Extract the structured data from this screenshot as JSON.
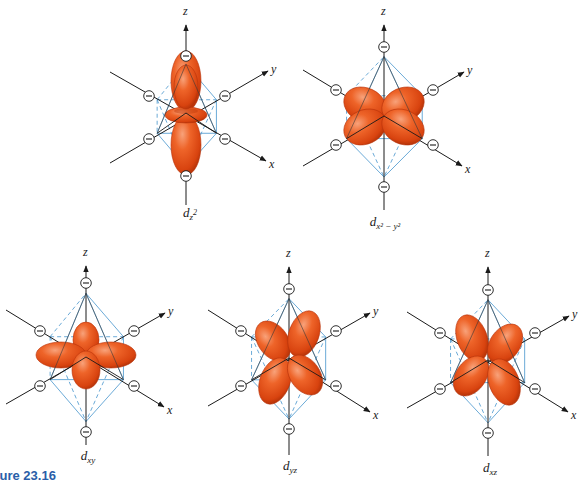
{
  "figure": {
    "caption": "Figure 23.16",
    "caption_visible": "re 23.16",
    "colors": {
      "lobe_fill": "#e8531c",
      "lobe_highlight": "#f58a5a",
      "lobe_shadow": "#b8330a",
      "octahedron_edge": "#5aa0d2",
      "axis": "#1a1a1a",
      "ligand_ring": "#1a1a1a",
      "caption": "#2a5ea8"
    },
    "ligand_symbol": "minus-circle",
    "axis_labels": {
      "x": "x",
      "y": "y",
      "z": "z"
    }
  },
  "panels": [
    {
      "id": "dz2",
      "label_main": "d",
      "label_sub": "z",
      "label_sup": "2",
      "label_full": "d_z²",
      "center": [
        186,
        113
      ],
      "z_top": [
        186,
        22
      ],
      "z_bottom": [
        186,
        205
      ],
      "ion_top": [
        186,
        56
      ],
      "ion_bottom": [
        186,
        176
      ],
      "ion_ul": [
        149,
        96
      ],
      "ion_ur": [
        225,
        96
      ],
      "ion_ll": [
        149,
        139
      ],
      "ion_lr": [
        225,
        139
      ],
      "line_ul": [
        110,
        72
      ],
      "line_ll": [
        110,
        163
      ],
      "y_arrow": [
        268,
        71
      ],
      "x_arrow": [
        266,
        161
      ],
      "label_pos": [
        190,
        215
      ]
    },
    {
      "id": "dx2-y2",
      "label_main": "d",
      "label_sub": "x² − y²",
      "label_sup": "",
      "label_full": "d_x²−y²",
      "center": [
        384,
        116
      ],
      "z_top": [
        384,
        22
      ],
      "z_bottom": [
        384,
        210
      ],
      "ion_top": [
        384,
        47
      ],
      "ion_bottom": [
        384,
        187
      ],
      "ion_ul": [
        336,
        90
      ],
      "ion_ur": [
        433,
        90
      ],
      "ion_ll": [
        336,
        145
      ],
      "ion_lr": [
        433,
        145
      ],
      "line_ul": [
        303,
        70
      ],
      "line_ll": [
        303,
        166
      ],
      "y_arrow": [
        464,
        72
      ],
      "x_arrow": [
        462,
        166
      ],
      "label_pos": [
        385,
        224
      ]
    },
    {
      "id": "dxy",
      "label_main": "d",
      "label_sub": "xy",
      "label_sup": "",
      "label_full": "d_xy",
      "center": [
        86,
        357
      ],
      "z_top": [
        86,
        263
      ],
      "z_bottom": [
        86,
        445
      ],
      "ion_top": [
        86,
        283
      ],
      "ion_bottom": [
        86,
        432
      ],
      "ion_ul": [
        40,
        331
      ],
      "ion_ur": [
        134,
        331
      ],
      "ion_ll": [
        40,
        386
      ],
      "ion_lr": [
        134,
        386
      ],
      "line_ul": [
        6,
        310
      ],
      "line_ll": [
        6,
        404
      ],
      "y_arrow": [
        165,
        313
      ],
      "x_arrow": [
        164,
        407
      ],
      "label_pos": [
        88,
        458
      ]
    },
    {
      "id": "dyz",
      "label_main": "d",
      "label_sub": "yz",
      "label_sup": "",
      "label_full": "d_yz",
      "center": [
        289,
        358
      ],
      "z_top": [
        289,
        264
      ],
      "z_bottom": [
        289,
        455
      ],
      "ion_top": [
        289,
        289
      ],
      "ion_bottom": [
        289,
        429
      ],
      "ion_ul": [
        241,
        331
      ],
      "ion_ur": [
        336,
        331
      ],
      "ion_ll": [
        241,
        386
      ],
      "ion_lr": [
        336,
        386
      ],
      "line_ul": [
        208,
        310
      ],
      "line_ll": [
        208,
        406
      ],
      "y_arrow": [
        370,
        313
      ],
      "x_arrow": [
        370,
        412
      ],
      "label_pos": [
        290,
        468
      ]
    },
    {
      "id": "dxz",
      "label_main": "d",
      "label_sub": "xz",
      "label_sup": "",
      "label_full": "d_xz",
      "center": [
        488,
        360
      ],
      "z_top": [
        488,
        264
      ],
      "z_bottom": [
        488,
        456
      ],
      "ion_top": [
        488,
        290
      ],
      "ion_bottom": [
        488,
        433
      ],
      "ion_ul": [
        440,
        333
      ],
      "ion_ur": [
        535,
        333
      ],
      "ion_ll": [
        440,
        389
      ],
      "ion_lr": [
        535,
        389
      ],
      "line_ul": [
        407,
        312
      ],
      "line_ll": [
        407,
        408
      ],
      "y_arrow": [
        569,
        316
      ],
      "x_arrow": [
        568,
        412
      ],
      "label_pos": [
        490,
        470
      ]
    }
  ]
}
